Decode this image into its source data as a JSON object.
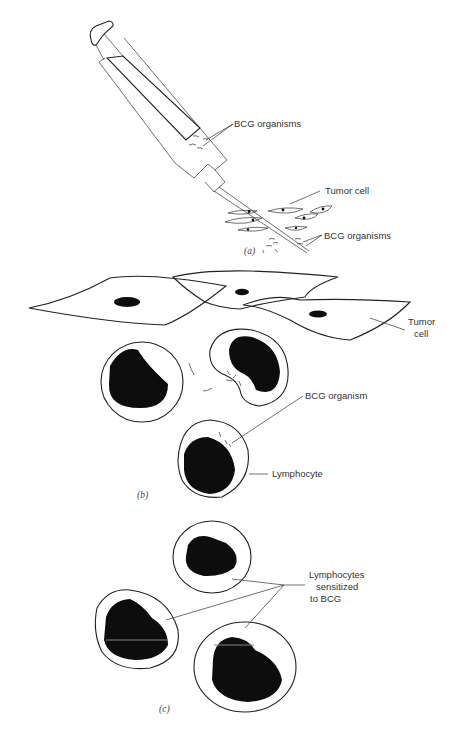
{
  "figure": {
    "panels": [
      {
        "id": "a",
        "caption": "(a)",
        "labels": {
          "syringe_contents": "BCG organisms",
          "tumor": "Tumor cell",
          "injected": "BCG organisms"
        }
      },
      {
        "id": "b",
        "caption": "(b)",
        "labels": {
          "tumor_line1": "Tumor",
          "tumor_line2": "cell",
          "organism": "BCG organism",
          "lymphocyte": "Lymphocyte"
        }
      },
      {
        "id": "c",
        "caption": "(c)",
        "labels": {
          "line1": "Lymphocytes",
          "line2": "sensitized",
          "line3": "to BCG"
        }
      }
    ],
    "colors": {
      "ink": "#111111",
      "background": "#ffffff"
    }
  }
}
